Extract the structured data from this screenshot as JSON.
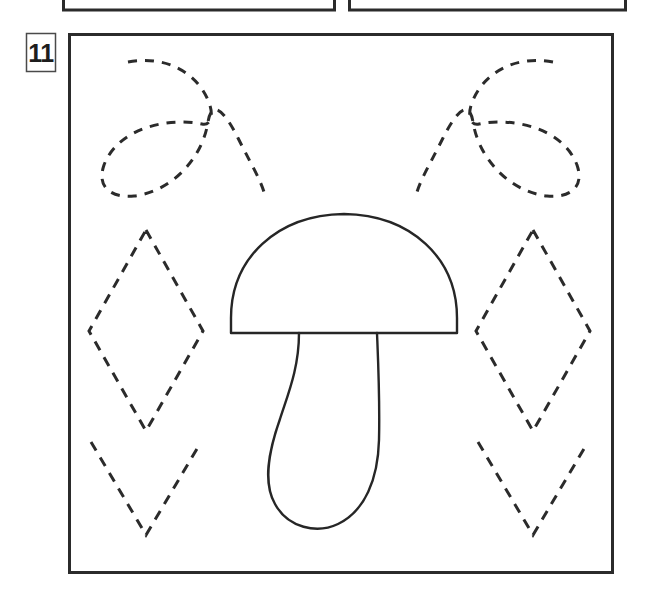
{
  "page": {
    "width": 648,
    "height": 600,
    "background": "#ffffff",
    "ink_color": "#262626",
    "type": "tracing-worksheet"
  },
  "exercise": {
    "number_label": "11",
    "badge": {
      "x": 26,
      "y": 33,
      "width": 30,
      "height": 39,
      "border_color": "#4a4a4a"
    },
    "frame": {
      "x": 68,
      "y": 33,
      "width": 545,
      "height": 540,
      "border_color": "#2b2b2b",
      "border_width": 3
    }
  },
  "previous_exercises": [
    {
      "name": "partial-box-left",
      "x": 62,
      "y": -40,
      "width": 274,
      "height": 50,
      "border_color": "#2b2b2b",
      "border_width": 3
    },
    {
      "name": "partial-box-right",
      "x": 348,
      "y": -40,
      "width": 279,
      "height": 50,
      "border_color": "#2b2b2b",
      "border_width": 3
    }
  ],
  "tracing_shapes": {
    "dash_pattern": "9 8",
    "dash_width": 3,
    "loops": [
      {
        "name": "dashed-loop-left",
        "path": "M128,62 C165,55 196,72 208,100 C215,116 210,126 202,124 C168,117 118,128 104,165 C96,188 112,198 134,196 C170,192 202,160 208,122 C212,98 225,112 238,138 C252,166 262,182 265,196"
      },
      {
        "name": "dashed-loop-right",
        "path": "M553,62 C516,55 485,72 473,100 C466,116 471,126 479,124 C513,117 563,128 577,165 C585,188 569,198 547,196 C511,192 479,160 473,122 C469,98 456,112 443,138 C429,166 419,182 416,196"
      }
    ],
    "diamonds": [
      {
        "name": "dashed-diamond-upper-left",
        "cx": 146,
        "top_y": 230,
        "mid_y": 331,
        "bottom_y": 431,
        "half_w": 57,
        "full": true
      },
      {
        "name": "dashed-diamond-upper-right",
        "cx": 533,
        "top_y": 230,
        "mid_y": 331,
        "bottom_y": 431,
        "half_w": 57,
        "full": true
      },
      {
        "name": "dashed-vee-lower-left",
        "cx": 146,
        "top_y": 442,
        "bottom_y": 535,
        "half_w": 55,
        "full": false
      },
      {
        "name": "dashed-vee-lower-right",
        "cx": 533,
        "top_y": 442,
        "bottom_y": 535,
        "half_w": 55,
        "full": false
      }
    ]
  },
  "picture": {
    "name": "mushroom",
    "stroke_color": "#262626",
    "stroke_width": 2.4,
    "cap": {
      "left_x": 230,
      "right_x": 458,
      "base_y": 333,
      "apex_y": 214,
      "path": "M231,333 L231,320 C231,260 276,215 344,214 C412,215 457,260 457,320 L457,333 Z"
    },
    "stem": {
      "path": "M299,333 C299,370 288,396 280,420 C268,454 264,482 275,504 C287,527 316,533 337,524 C364,512 378,480 379,440 C380,400 378,360 377,333"
    }
  }
}
